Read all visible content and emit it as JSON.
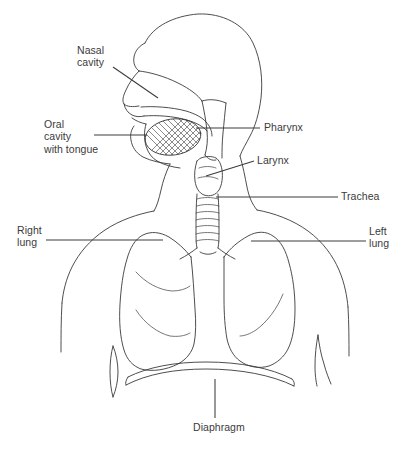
{
  "figure": {
    "type": "anatomical-line-diagram",
    "background_color": "#ffffff",
    "line_color": "#3a3a3a",
    "text_color": "#3b3b3b"
  },
  "labels": {
    "nasal_cavity": "Nasal\ncavity",
    "oral_cavity": "Oral\ncavity\nwith tongue",
    "pharynx": "Pharynx",
    "larynx": "Larynx",
    "trachea": "Trachea",
    "right_lung": "Right\nlung",
    "left_lung": "Left\nlung",
    "diaphragm": "Diaphragm"
  },
  "caption": {
    "text": ""
  },
  "parts": [
    {
      "id": "nasal-cavity",
      "name": "Nasal cavity"
    },
    {
      "id": "oral-cavity",
      "name": "Oral cavity with tongue"
    },
    {
      "id": "pharynx",
      "name": "Pharynx"
    },
    {
      "id": "larynx",
      "name": "Larynx"
    },
    {
      "id": "trachea",
      "name": "Trachea"
    },
    {
      "id": "right-lung",
      "name": "Right lung"
    },
    {
      "id": "left-lung",
      "name": "Left lung"
    },
    {
      "id": "diaphragm",
      "name": "Diaphragm"
    }
  ]
}
